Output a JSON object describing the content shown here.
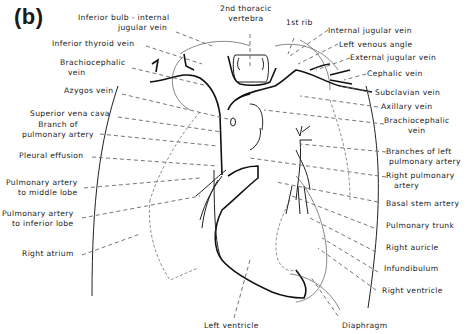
{
  "figure": {
    "panel_label": "(b)",
    "labels": {
      "inferior_bulb_1": "Inferior bulb - internal",
      "inferior_bulb_2": "jugular vein",
      "inferior_thyroid_vein": "Inferior thyroid vein",
      "brachiocephalic_vein_right_1": "Brachiocephalic",
      "brachiocephalic_vein_right_2": "vein",
      "azygos_vein": "Azygos vein",
      "superior_vena_cava": "Superior vena cava",
      "branch_pulmonary_artery_1": "Branch of",
      "branch_pulmonary_artery_2": "pulmonary artery",
      "pleural_effusion": "Pleural effusion",
      "pa_middle_lobe_1": "Pulmonary artery",
      "pa_middle_lobe_2": "to middle lobe",
      "pa_inferior_lobe_1": "Pulmonary artery",
      "pa_inferior_lobe_2": "to inferior lobe",
      "right_atrium": "Right atrium",
      "second_thoracic_vertebra_1": "2nd thoracic",
      "second_thoracic_vertebra_2": "vertebra",
      "first_rib": "1st rib",
      "internal_jugular_vein": "Internal jugular vein",
      "left_venous_angle": "Left venous angle",
      "external_jugular_vein": "External jugular vein",
      "cephalic_vein": "Cephalic vein",
      "subclavian_vein": "Subclavian vein",
      "axillary_vein": "Axillary vein",
      "brachiocephalic_vein_left_1": "Brachiocephalic",
      "brachiocephalic_vein_left_2": "vein",
      "branches_left_pa_1": "Branches of left",
      "branches_left_pa_2": "pulmonary artery",
      "right_pulmonary_artery_1": "Right pulmonary",
      "right_pulmonary_artery_2": "artery",
      "basal_stem_artery": "Basal stem artery",
      "pulmonary_trunk": "Pulmonary trunk",
      "right_auricle": "Right auricle",
      "infundibulum": "Infundibulum",
      "right_ventricle": "Right ventricle",
      "left_ventricle": "Left ventricle",
      "diaphragm": "Diaphragm"
    }
  }
}
